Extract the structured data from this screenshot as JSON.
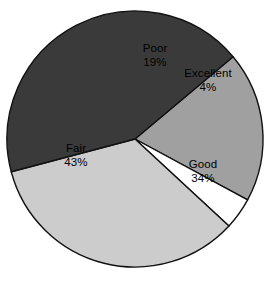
{
  "chart_data": {
    "type": "pie",
    "title": "",
    "subtitle": "",
    "xlabel": "",
    "ylabel": "",
    "legend": "none",
    "grid": false,
    "value_unit": "%",
    "categories": [
      "Poor",
      "Excellent",
      "Good",
      "Fair"
    ],
    "values": [
      19,
      4,
      34,
      43
    ],
    "slices": [
      {
        "label": "Poor",
        "value": 19,
        "value_text": "19%",
        "color": "#a0a0a0",
        "start_angle": 320,
        "end_angle": 388.4,
        "label_x": 155,
        "label_y": 55
      },
      {
        "label": "Excellent",
        "value": 4,
        "value_text": "4%",
        "color": "#ffffff",
        "start_angle": 388.4,
        "end_angle": 402.8,
        "label_x": 208,
        "label_y": 80
      },
      {
        "label": "Good",
        "value": 34,
        "value_text": "34%",
        "color": "#cccccc",
        "start_angle": 402.8,
        "end_angle": 525.2,
        "label_x": 203,
        "label_y": 171
      },
      {
        "label": "Fair",
        "value": 43,
        "value_text": "43%",
        "color": "#3a3a3a",
        "start_angle": 525.2,
        "end_angle": 680,
        "label_x": 76,
        "label_y": 155
      }
    ],
    "geometry": {
      "center_x": 135,
      "center_y": 139,
      "radius": 128
    },
    "outline_color": "#111111",
    "background_color": "#ffffff"
  }
}
